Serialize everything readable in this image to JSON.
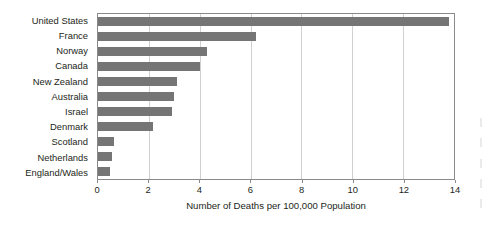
{
  "chart_data": {
    "type": "bar",
    "orientation": "horizontal",
    "title": "",
    "subtitle": "",
    "xlabel": "Number of Deaths per 100,000 Population",
    "ylabel": "",
    "xlim": [
      0,
      14
    ],
    "ylim": null,
    "grid": true,
    "grid_axis": "x",
    "legend": false,
    "legend_position": "none",
    "xticks": [
      0,
      2,
      4,
      6,
      8,
      10,
      12,
      14
    ],
    "xtick_labels": [
      "0",
      "2",
      "4",
      "6",
      "8",
      "10",
      "12",
      "14"
    ],
    "categories": [
      "United States",
      "France",
      "Norway",
      "Canada",
      "New Zealand",
      "Australia",
      "Israel",
      "Denmark",
      "Scotland",
      "Netherlands",
      "England/Wales"
    ],
    "values": [
      13.8,
      6.2,
      4.3,
      4.0,
      3.1,
      3.0,
      2.9,
      2.15,
      0.62,
      0.55,
      0.47
    ],
    "bar_color": "#757575",
    "series": [
      {
        "name": "Number of Deaths per 100,000 Population",
        "values": [
          13.8,
          6.2,
          4.3,
          4.0,
          3.1,
          3.0,
          2.9,
          2.15,
          0.62,
          0.55,
          0.47
        ]
      }
    ]
  },
  "colors": {
    "bar": "#757575",
    "gridline": "#d0d0d0",
    "axis": "#8a8a8a",
    "text": "#231f20",
    "background": "#ffffff"
  },
  "edge_marks": {
    "count": 5
  }
}
